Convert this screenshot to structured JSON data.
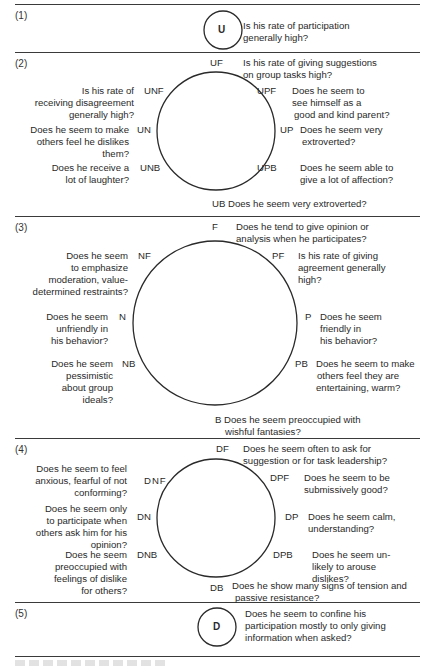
{
  "sections": [
    {
      "number": "(1)",
      "center_code": "U",
      "question": [
        "Is his rate of participation",
        "generally high?"
      ]
    },
    {
      "number": "(2)",
      "items": {
        "top": {
          "code": "UF",
          "question": [
            "Is his rate of giving suggestions",
            "on group tasks high?"
          ]
        },
        "top_right": {
          "code": "UPF",
          "question": [
            "Does he seem to",
            "see himself as a",
            "good and kind parent?"
          ]
        },
        "right": {
          "code": "UP",
          "question": [
            "Does he seem very",
            "extroverted?"
          ]
        },
        "bottom_right": {
          "code": "UPB",
          "question": [
            "Does he seem able to",
            "give a lot of affection?"
          ]
        },
        "bottom": {
          "code": "UB",
          "question": [
            "Does he seem very extroverted?"
          ]
        },
        "bottom_left": {
          "code": "UNB",
          "question": [
            "Does he receive a",
            "lot of laughter?"
          ]
        },
        "left": {
          "code": "UN",
          "question": [
            "Does he seem to make",
            "others feel he dislikes",
            "them?"
          ]
        },
        "top_left": {
          "code": "UNF",
          "question": [
            "Is his rate of",
            "receiving disagreement",
            "generally high?"
          ]
        }
      }
    },
    {
      "number": "(3)",
      "items": {
        "top": {
          "code": "F",
          "question": [
            "Does he tend to give opinion or",
            "analysis when he participates?"
          ]
        },
        "top_right": {
          "code": "PF",
          "question": [
            "Is his rate  of giving",
            "agreement  generally",
            "high?"
          ]
        },
        "right": {
          "code": "P",
          "question": [
            "Does he seem",
            "friendly in",
            "his behavior?"
          ]
        },
        "bottom_right": {
          "code": "PB",
          "question": [
            "Does he seem to make",
            "others  feel they are",
            "entertaining,  warm?"
          ]
        },
        "bottom": {
          "code": "B",
          "question": [
            "Does he seem preoccupied with",
            "wishful fantasies?"
          ]
        },
        "bottom_left": {
          "code": "NB",
          "question": [
            "Does he seem",
            "pessimistic",
            "about group",
            "ideals?"
          ]
        },
        "left": {
          "code": "N",
          "question": [
            "Does he seem",
            "unfriendly in",
            "his behavior?"
          ]
        },
        "top_left": {
          "code": "NF",
          "question": [
            "Does he seem",
            "to emphasize",
            "moderation, value-",
            "determined  restraints?"
          ]
        }
      }
    },
    {
      "number": "(4)",
      "items": {
        "top": {
          "code": "DF",
          "question": [
            "Does he seem often to ask for",
            "suggestion or for task leadership?"
          ]
        },
        "top_right": {
          "code": "DPF",
          "question": [
            "Does he seem to be",
            "submissively good?"
          ]
        },
        "right": {
          "code": "DP",
          "question": [
            "Does he seem calm,",
            "understanding?"
          ]
        },
        "bottom_right": {
          "code": "DPB",
          "question": [
            "Does he seem un-",
            "likely to arouse",
            "dislikes?"
          ]
        },
        "bottom": {
          "code": "DB",
          "question": [
            "Does he show many signs of tension and",
            "passive resistance?"
          ]
        },
        "bottom_left": {
          "code": "DNB",
          "question": [
            "Does he seem",
            "preoccupied with",
            "feelings of dislike",
            "for others?"
          ]
        },
        "left": {
          "code": "DN",
          "question": [
            "Does he seem only",
            "to participate when",
            "others ask him for his",
            "opinion?"
          ]
        },
        "top_left": {
          "code": "DNF",
          "question": [
            "Does he seem to feel",
            "anxious, fearful of not",
            "conforming?"
          ]
        }
      }
    },
    {
      "number": "(5)",
      "center_code": "D",
      "question": [
        "Does he seem to confine his",
        "participation mostly to only giving",
        "information when asked?"
      ]
    }
  ],
  "colors": {
    "ink": "#2a2a2a",
    "rule": "#3a3a3a",
    "background": "#ffffff"
  }
}
